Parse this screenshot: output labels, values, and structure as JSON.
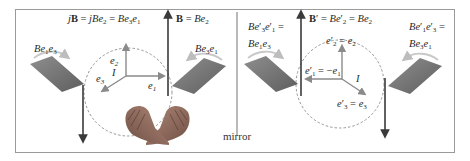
{
  "figure": {
    "left_panel": {
      "label_jB": [
        "j",
        "B",
        " = ",
        "j",
        "Be",
        "2",
        " = ",
        "Be",
        "3",
        "e",
        "1"
      ],
      "label_B": [
        "B",
        " = ",
        "Be",
        "2"
      ],
      "plane_left_label": [
        "Be",
        "1",
        "e",
        "3"
      ],
      "plane_right_label": [
        "Be",
        "3",
        "e",
        "1"
      ],
      "axes": {
        "e1": [
          "e",
          "1"
        ],
        "e2": [
          "e",
          "2"
        ],
        "e3": [
          "e",
          "3"
        ],
        "pseudoscalar": "I"
      }
    },
    "mirror_label": "mirror",
    "right_panel": {
      "label_Bprime": [
        "B",
        "′",
        " = ",
        "Be",
        "′",
        "2",
        " = ",
        "Be",
        "2"
      ],
      "plane_left_label_line1": [
        "Be",
        "′",
        "3",
        "e",
        "′",
        "1",
        " ="
      ],
      "plane_left_label_line2": [
        "Be",
        "1",
        "e",
        "3"
      ],
      "plane_right_label_line1": [
        "Be",
        "′",
        "1",
        "e",
        "′",
        "3",
        " ="
      ],
      "plane_right_label_line2": [
        "Be",
        "3",
        "e",
        "1"
      ],
      "axes": {
        "e1p": [
          "e",
          "′",
          "1",
          " = −",
          "e",
          "1"
        ],
        "e2p": [
          "e",
          "′",
          "2",
          " = ",
          "e",
          "2"
        ],
        "e3p": [
          "e",
          "′",
          "3",
          " = ",
          "e",
          "3"
        ],
        "pseudoscalar": "I"
      }
    },
    "colors": {
      "frame": "#9a9a9a",
      "vector_arrow": "#3a3a3a",
      "axis_arrow": "#8a8a8a",
      "plane_fill": "#7a7a7a",
      "plane_rotation_arrow": "#c8c8c8",
      "dashed_circle": "#8a8a8a",
      "mirror_line": "#8a8a8a",
      "hand": "#8c6a5c"
    }
  }
}
